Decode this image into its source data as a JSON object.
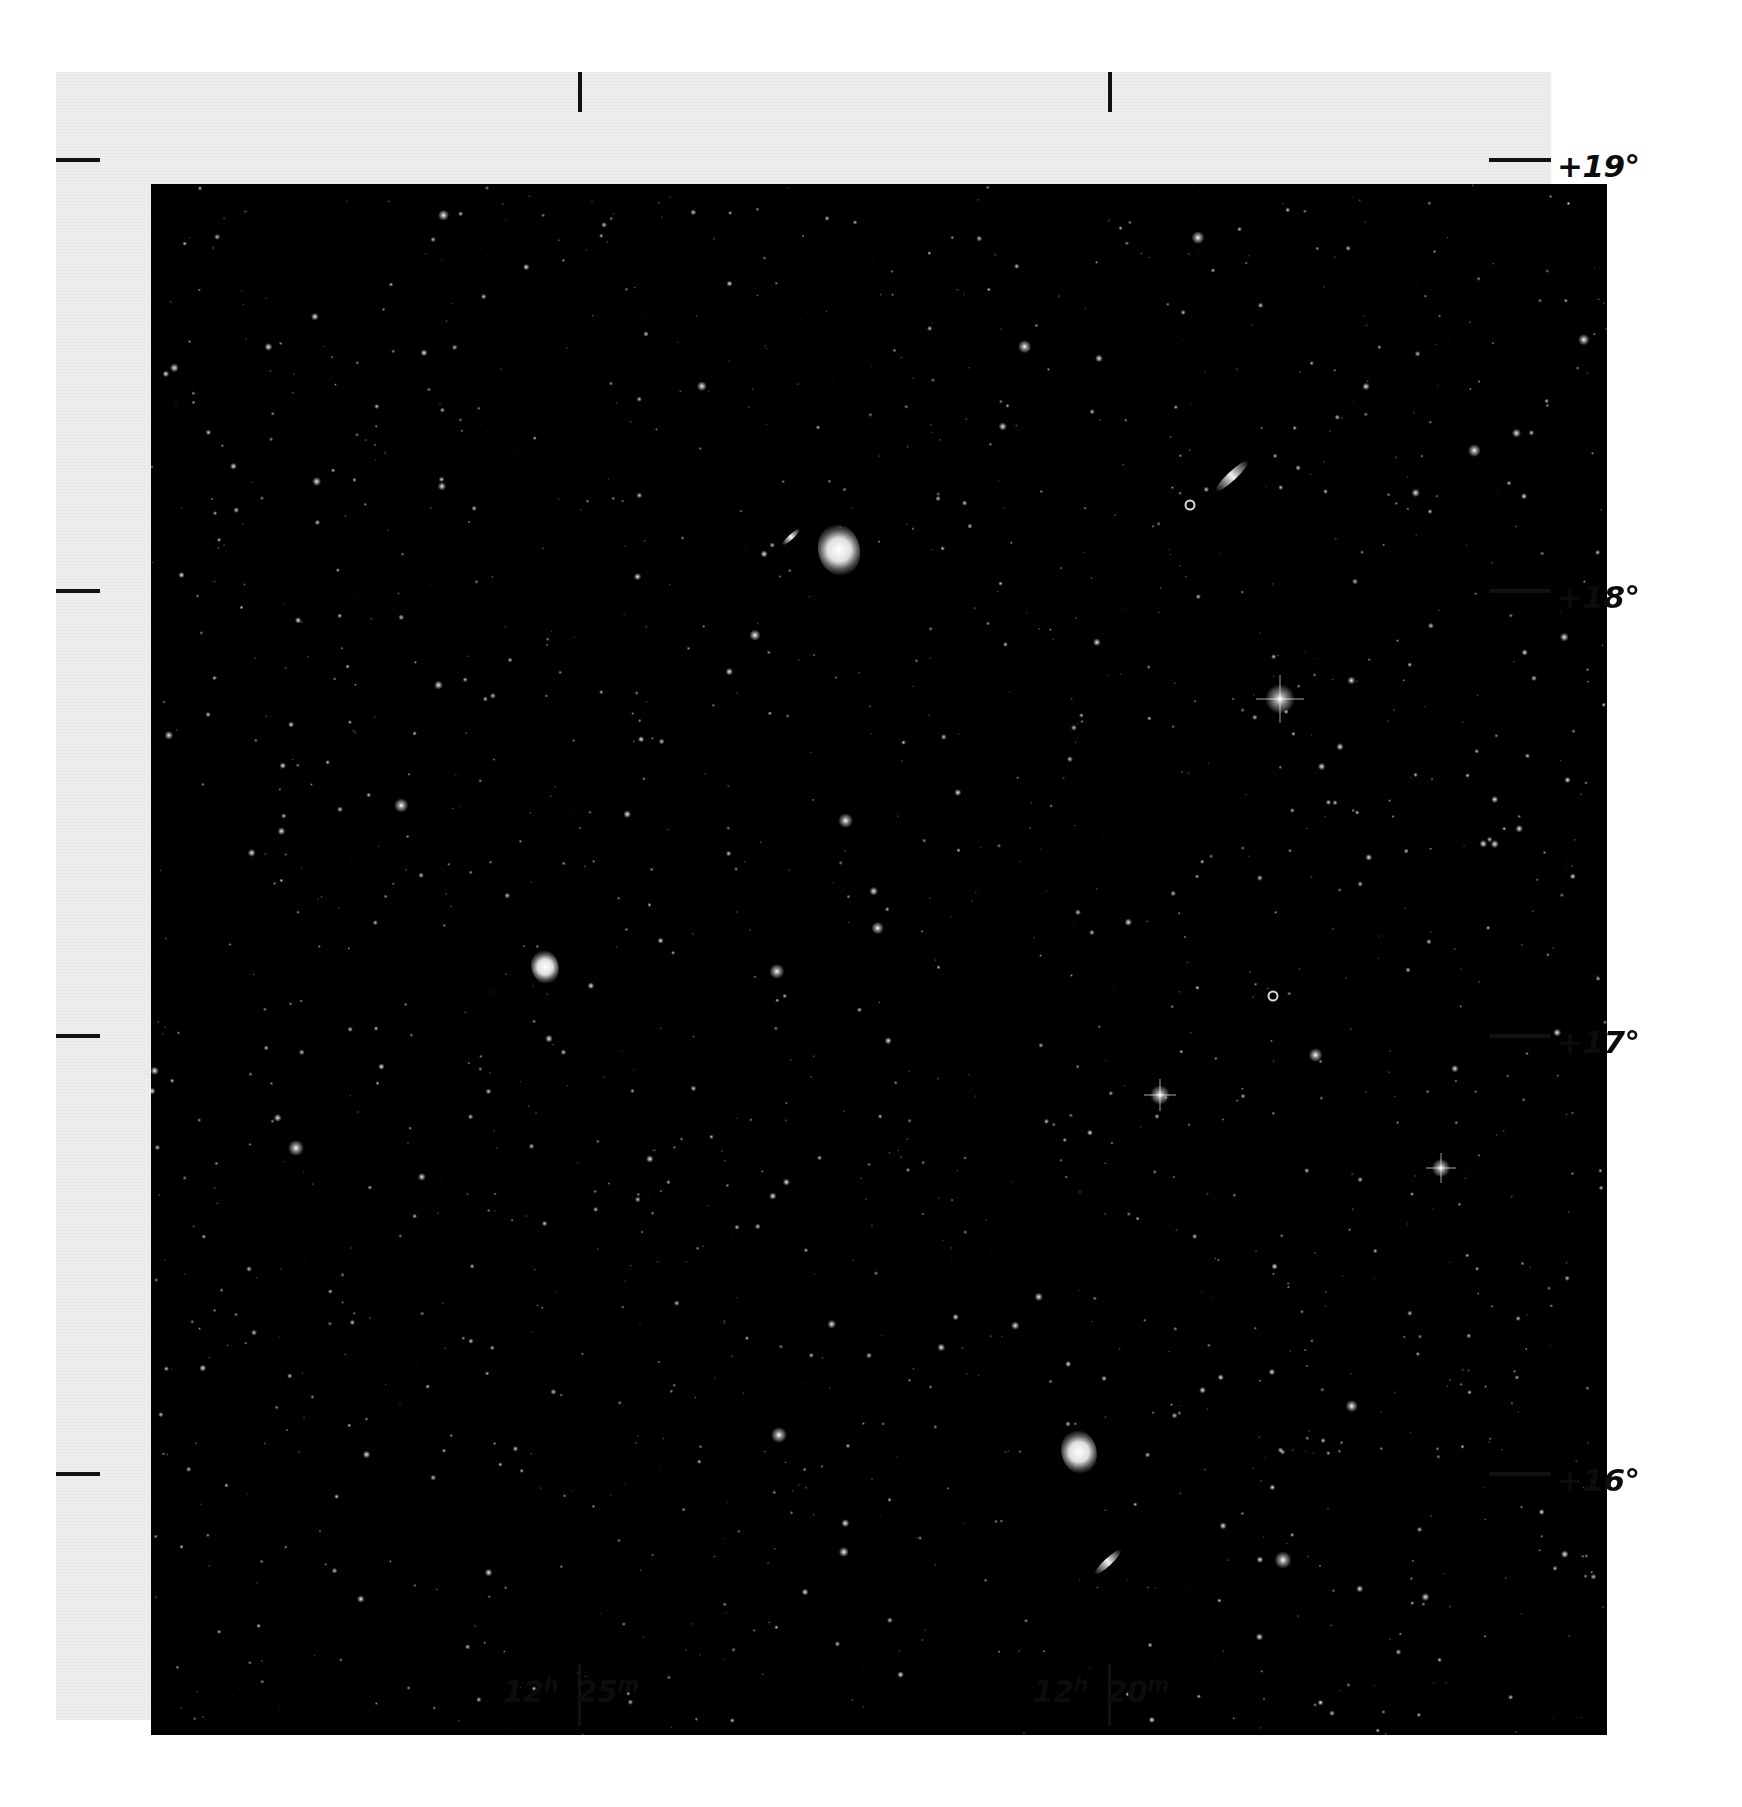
{
  "figure": {
    "kind": "photographic-sky-plate",
    "background_color": "#ffffff",
    "paper_color": "#eeeeec",
    "sky_color": "#010101",
    "ink_color": "#0c0c0c"
  },
  "axes": {
    "declination": {
      "axis_label": "Declination",
      "side": "right",
      "ticks": [
        {
          "label": "+19°",
          "value": 19,
          "y": 160
        },
        {
          "label": "+18°",
          "value": 18,
          "y": 591
        },
        {
          "label": "+17°",
          "value": 17,
          "y": 1036
        },
        {
          "label": "+16°",
          "value": 16,
          "y": 1474
        }
      ]
    },
    "right_ascension": {
      "axis_label": "Right Ascension",
      "side": "bottom",
      "ticks": [
        {
          "hours": "12",
          "hours_sup": "h",
          "minutes": "25",
          "minutes_sup": "m",
          "label": "12h 25m",
          "x": 578
        },
        {
          "hours": "12",
          "hours_sup": "h",
          "minutes": "20",
          "minutes_sup": "m",
          "label": "12h 20m",
          "x": 1108
        }
      ]
    }
  },
  "chart_data": {
    "type": "scatter",
    "title": "",
    "xlabel": "Right Ascension",
    "ylabel": "Declination",
    "xlim": [
      "12h 27m",
      "12h 18m"
    ],
    "ylim": [
      15.6,
      19.4
    ],
    "grid": false,
    "legend": "none",
    "x_tick_labels": [
      "12h 25m",
      "12h 20m"
    ],
    "y_tick_labels": [
      "+19°",
      "+18°",
      "+17°",
      "+16°"
    ],
    "star_count_estimate": 1400,
    "bright_objects": [
      {
        "name": "large bright elliptical nebulosity",
        "x_px": 688,
        "y_px": 366,
        "size_px": 26,
        "kind": "galaxy"
      },
      {
        "name": "small elongated companion",
        "x_px": 640,
        "y_px": 353,
        "size_px": 12,
        "kind": "edge-on-galaxy"
      },
      {
        "name": "edge-on streak upper right",
        "x_px": 1081,
        "y_px": 292,
        "size_px": 22,
        "kind": "edge-on-galaxy"
      },
      {
        "name": "bright saturated star",
        "x_px": 1129,
        "y_px": 515,
        "size_px": 24,
        "kind": "star"
      },
      {
        "name": "diffuse knot mid-left",
        "x_px": 394,
        "y_px": 783,
        "size_px": 17,
        "kind": "galaxy"
      },
      {
        "name": "bright star with diffraction cross",
        "x_px": 1009,
        "y_px": 911,
        "size_px": 16,
        "kind": "star"
      },
      {
        "name": "mottled spiral lower centre",
        "x_px": 928,
        "y_px": 1268,
        "size_px": 22,
        "kind": "galaxy"
      },
      {
        "name": "bright star right edge",
        "x_px": 1290,
        "y_px": 984,
        "size_px": 15,
        "kind": "star"
      },
      {
        "name": "bright star lower right",
        "x_px": 1132,
        "y_px": 1376,
        "size_px": 14,
        "kind": "star"
      },
      {
        "name": "bright star left",
        "x_px": 145,
        "y_px": 964,
        "size_px": 13,
        "kind": "star"
      },
      {
        "name": "ring galaxy top right",
        "x_px": 1039,
        "y_px": 321,
        "size_px": 9,
        "kind": "ring-galaxy"
      },
      {
        "name": "ring galaxy mid right",
        "x_px": 1122,
        "y_px": 812,
        "size_px": 9,
        "kind": "ring-galaxy"
      },
      {
        "name": "bright star lower left",
        "x_px": 628,
        "y_px": 1251,
        "size_px": 13,
        "kind": "star"
      },
      {
        "name": "streak lower centre",
        "x_px": 957,
        "y_px": 1378,
        "size_px": 18,
        "kind": "edge-on-galaxy"
      }
    ]
  }
}
